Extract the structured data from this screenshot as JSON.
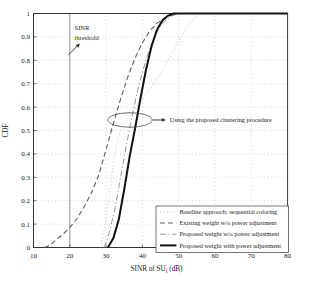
{
  "figure": {
    "bg_color": "#ffffff",
    "frame_color": "#333333",
    "grid_color": "#b9b9b9",
    "annotation_color": "#333333"
  },
  "chart_data": {
    "type": "line",
    "title": "",
    "xlabel_prefix": "SINR of SU",
    "xlabel_sub": "f",
    "xlabel_suffix": " (dB)",
    "ylabel": "CDF",
    "xlim": [
      10,
      80
    ],
    "ylim": [
      0,
      1
    ],
    "xticks": [
      10,
      20,
      30,
      40,
      50,
      60,
      70,
      80
    ],
    "yticks": [
      0,
      0.1,
      0.2,
      0.3,
      0.4,
      0.5,
      0.6,
      0.7,
      0.8,
      0.9,
      1
    ],
    "grid": "dotted",
    "legend_position": "lower right",
    "series": [
      {
        "name": "Baseline approach: sequential coloring",
        "style": "dotted",
        "color": "#c3c3c3",
        "width": 1.0,
        "points": [
          [
            28.5,
            0
          ],
          [
            29.5,
            0.08
          ],
          [
            30.5,
            0.18
          ],
          [
            31.5,
            0.3
          ],
          [
            32.5,
            0.41
          ],
          [
            33.5,
            0.48
          ],
          [
            34.5,
            0.525
          ],
          [
            36.5,
            0.565
          ],
          [
            39,
            0.615
          ],
          [
            42,
            0.675
          ],
          [
            45,
            0.745
          ],
          [
            48,
            0.825
          ],
          [
            50,
            0.88
          ],
          [
            52,
            0.935
          ],
          [
            54,
            0.975
          ],
          [
            56,
            1
          ],
          [
            80,
            1
          ]
        ]
      },
      {
        "name": "Existing weight w/o power adjustment",
        "style": "dashed",
        "color": "#5e5e5e",
        "width": 1.1,
        "points": [
          [
            13,
            0
          ],
          [
            14.5,
            0.01
          ],
          [
            16,
            0.03
          ],
          [
            18,
            0.055
          ],
          [
            20,
            0.085
          ],
          [
            22,
            0.125
          ],
          [
            24,
            0.175
          ],
          [
            26,
            0.235
          ],
          [
            28,
            0.31
          ],
          [
            30,
            0.42
          ],
          [
            32,
            0.53
          ],
          [
            34,
            0.635
          ],
          [
            36,
            0.73
          ],
          [
            38,
            0.81
          ],
          [
            40,
            0.875
          ],
          [
            42,
            0.925
          ],
          [
            44,
            0.958
          ],
          [
            46,
            0.98
          ],
          [
            48,
            0.992
          ],
          [
            50,
            1
          ],
          [
            80,
            1
          ]
        ]
      },
      {
        "name": "Proposed weight w/o power adjustment",
        "style": "dashdot",
        "color": "#979797",
        "width": 1.0,
        "points": [
          [
            29.5,
            0
          ],
          [
            31,
            0.07
          ],
          [
            32.5,
            0.17
          ],
          [
            34,
            0.3
          ],
          [
            35.5,
            0.43
          ],
          [
            37,
            0.55
          ],
          [
            38.5,
            0.66
          ],
          [
            40,
            0.75
          ],
          [
            42,
            0.85
          ],
          [
            44,
            0.92
          ],
          [
            46,
            0.965
          ],
          [
            48,
            0.99
          ],
          [
            50,
            1
          ],
          [
            80,
            1
          ]
        ]
      },
      {
        "name": "Proposed weight with power adjustment",
        "style": "solid",
        "color": "#121212",
        "width": 2.0,
        "points": [
          [
            30.5,
            0
          ],
          [
            32,
            0.04
          ],
          [
            33.5,
            0.12
          ],
          [
            35,
            0.25
          ],
          [
            36.5,
            0.39
          ],
          [
            38,
            0.51
          ],
          [
            39.5,
            0.64
          ],
          [
            41,
            0.76
          ],
          [
            42.5,
            0.86
          ],
          [
            44,
            0.93
          ],
          [
            45.5,
            0.97
          ],
          [
            47,
            0.99
          ],
          [
            48.5,
            1
          ],
          [
            80,
            1
          ]
        ]
      }
    ],
    "annotations": {
      "threshold": {
        "line_x": 20,
        "label_line1": "SINR",
        "label_line2": "threshold",
        "text_x": 21.3,
        "text_y": 0.93,
        "text_y2": 0.885,
        "arrow_tail": [
          19.6,
          0.823
        ],
        "arrow_head": [
          22.8,
          0.872
        ]
      },
      "clustering": {
        "label": "Using the proposed clustering procedure",
        "ellipse_cx": 36.6,
        "ellipse_cy": 0.545,
        "ellipse_rx": 6.1,
        "ellipse_ry": 0.031,
        "arrow_tail": [
          42.9,
          0.545
        ],
        "arrow_head": [
          46.5,
          0.545
        ],
        "text_x": 47.5,
        "text_y": 0.545
      }
    }
  }
}
